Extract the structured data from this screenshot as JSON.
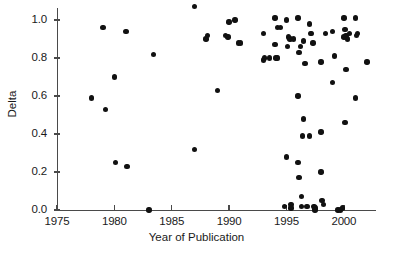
{
  "chart_data": {
    "type": "scatter",
    "title": "",
    "xlabel": "Year of Publication",
    "ylabel": "Delta",
    "xlim": [
      1975,
      2002.8
    ],
    "ylim": [
      0.0,
      1.1
    ],
    "xticks": [
      1975,
      1980,
      1985,
      1990,
      1995,
      2000
    ],
    "xticklabels": [
      "1975",
      "1980",
      "1985",
      "1990",
      "1995",
      "2000"
    ],
    "yticks": [
      0.0,
      0.2,
      0.4,
      0.6,
      0.8,
      1.0
    ],
    "yticklabels": [
      "0.0",
      "0.2",
      "0.4",
      "0.6",
      "0.8",
      "1.0"
    ],
    "grid": false,
    "legend": null,
    "marker": "filled-circle",
    "marker_color": "#111111",
    "axis_color": "#4a4a4a",
    "n_points": 85,
    "points": [
      {
        "x": 1978.0,
        "y": 0.59
      },
      {
        "x": 1979.0,
        "y": 0.96
      },
      {
        "x": 1979.2,
        "y": 0.53
      },
      {
        "x": 1980.0,
        "y": 0.7
      },
      {
        "x": 1980.1,
        "y": 0.25
      },
      {
        "x": 1981.0,
        "y": 0.94
      },
      {
        "x": 1981.1,
        "y": 0.23
      },
      {
        "x": 1983.4,
        "y": 0.82
      },
      {
        "x": 1983.0,
        "y": 0.0
      },
      {
        "x": 1987.0,
        "y": 1.07
      },
      {
        "x": 1987.0,
        "y": 0.32
      },
      {
        "x": 1988.0,
        "y": 0.9
      },
      {
        "x": 1988.1,
        "y": 0.92
      },
      {
        "x": 1989.0,
        "y": 0.63
      },
      {
        "x": 1989.7,
        "y": 0.92
      },
      {
        "x": 1989.9,
        "y": 0.91
      },
      {
        "x": 1990.0,
        "y": 0.99
      },
      {
        "x": 1990.5,
        "y": 1.0
      },
      {
        "x": 1990.8,
        "y": 0.88
      },
      {
        "x": 1993.0,
        "y": 0.93
      },
      {
        "x": 1993.0,
        "y": 0.79
      },
      {
        "x": 1993.1,
        "y": 0.8
      },
      {
        "x": 1994.0,
        "y": 1.01
      },
      {
        "x": 1994.2,
        "y": 0.96
      },
      {
        "x": 1994.0,
        "y": 0.87
      },
      {
        "x": 1994.1,
        "y": 0.8
      },
      {
        "x": 1994.2,
        "y": 0.8
      },
      {
        "x": 1995.0,
        "y": 1.0
      },
      {
        "x": 1995.2,
        "y": 0.91
      },
      {
        "x": 1995.3,
        "y": 0.9
      },
      {
        "x": 1995.1,
        "y": 0.86
      },
      {
        "x": 1995.0,
        "y": 0.28
      },
      {
        "x": 1995.4,
        "y": 0.03
      },
      {
        "x": 1995.4,
        "y": 0.01
      },
      {
        "x": 1996.0,
        "y": 1.01
      },
      {
        "x": 1996.2,
        "y": 0.86
      },
      {
        "x": 1996.1,
        "y": 0.83
      },
      {
        "x": 1996.0,
        "y": 0.6
      },
      {
        "x": 1996.0,
        "y": 0.25
      },
      {
        "x": 1996.1,
        "y": 0.17
      },
      {
        "x": 1996.3,
        "y": 0.07
      },
      {
        "x": 1996.3,
        "y": 0.02
      },
      {
        "x": 1996.5,
        "y": 0.89
      },
      {
        "x": 1996.6,
        "y": 0.77
      },
      {
        "x": 1996.5,
        "y": 0.48
      },
      {
        "x": 1996.4,
        "y": 0.39
      },
      {
        "x": 1997.0,
        "y": 0.98
      },
      {
        "x": 1997.1,
        "y": 0.93
      },
      {
        "x": 1997.2,
        "y": 0.93
      },
      {
        "x": 1997.0,
        "y": 0.39
      },
      {
        "x": 1997.4,
        "y": 0.02
      },
      {
        "x": 1997.5,
        "y": 0.01
      },
      {
        "x": 1997.5,
        "y": 0.0
      },
      {
        "x": 1998.0,
        "y": 0.78
      },
      {
        "x": 1998.0,
        "y": 0.41
      },
      {
        "x": 1998.0,
        "y": 0.2
      },
      {
        "x": 1998.1,
        "y": 0.05
      },
      {
        "x": 1998.2,
        "y": 0.03
      },
      {
        "x": 1999.0,
        "y": 0.94
      },
      {
        "x": 1999.2,
        "y": 0.81
      },
      {
        "x": 1999.0,
        "y": 0.67
      },
      {
        "x": 1999.5,
        "y": 0.0
      },
      {
        "x": 1999.7,
        "y": 0.0
      },
      {
        "x": 2000.0,
        "y": 1.01
      },
      {
        "x": 2000.1,
        "y": 0.95
      },
      {
        "x": 2000.2,
        "y": 0.92
      },
      {
        "x": 2000.0,
        "y": 0.91
      },
      {
        "x": 2000.3,
        "y": 0.9
      },
      {
        "x": 2000.2,
        "y": 0.74
      },
      {
        "x": 2000.1,
        "y": 0.46
      },
      {
        "x": 2001.0,
        "y": 1.01
      },
      {
        "x": 2001.2,
        "y": 0.93
      },
      {
        "x": 2001.1,
        "y": 0.92
      },
      {
        "x": 2001.0,
        "y": 0.59
      },
      {
        "x": 2002.0,
        "y": 0.78
      },
      {
        "x": 1993.5,
        "y": 0.8
      },
      {
        "x": 1994.5,
        "y": 0.96
      },
      {
        "x": 1991.0,
        "y": 0.88
      },
      {
        "x": 1997.3,
        "y": 0.88
      },
      {
        "x": 1995.6,
        "y": 0.9
      },
      {
        "x": 1998.4,
        "y": 0.93
      },
      {
        "x": 2000.5,
        "y": 0.93
      },
      {
        "x": 1999.9,
        "y": 0.01
      },
      {
        "x": 1996.8,
        "y": 0.02
      },
      {
        "x": 1994.8,
        "y": 0.02
      }
    ]
  }
}
